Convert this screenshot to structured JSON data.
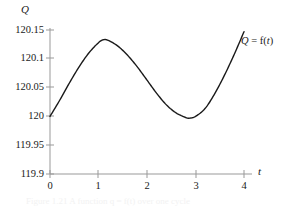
{
  "figure": {
    "y_axis_label": "Q",
    "x_axis_label": "t",
    "curve_annotation_var": "Q",
    "curve_annotation_eq": " = f(",
    "curve_annotation_arg": "t",
    "curve_annotation_close": ")",
    "caption": "Figure 1.21   A function q = f(t) over one cycle",
    "axis_color": "#999999",
    "curve_color": "#1a1a1a",
    "text_color": "#1a1a1a"
  },
  "chart_data": {
    "type": "line",
    "title": "",
    "xlabel": "t",
    "ylabel": "Q",
    "xlim": [
      0,
      4
    ],
    "ylim": [
      119.9,
      120.15
    ],
    "grid": false,
    "legend": "annotation-right",
    "annotations": [
      {
        "text": "Q = f(t)",
        "x": 4.0,
        "y": 120.14
      }
    ],
    "xticks": [
      "0",
      "1",
      "2",
      "3",
      "4"
    ],
    "xtick_values": [
      0,
      1,
      2,
      3,
      4
    ],
    "yticks": [
      "119.9",
      "119.95",
      "120",
      "120.05",
      "120.1",
      "120.15"
    ],
    "ytick_values": [
      119.9,
      119.95,
      120,
      120.05,
      120.1,
      120.15
    ],
    "series": [
      {
        "name": "Q = f(t)",
        "x": [
          0,
          0.2,
          0.4,
          0.6,
          0.8,
          1.0,
          1.1,
          1.2,
          1.4,
          1.6,
          1.8,
          2.0,
          2.2,
          2.4,
          2.6,
          2.8,
          2.88,
          3.0,
          3.2,
          3.4,
          3.6,
          3.8,
          4.0
        ],
        "values": [
          120.0,
          120.028,
          120.058,
          120.086,
          120.11,
          120.128,
          120.133,
          120.132,
          120.122,
          120.106,
          120.086,
          120.063,
          120.04,
          120.02,
          120.006,
          119.998,
          119.997,
          120.0,
          120.014,
          120.04,
          120.072,
          120.108,
          120.147
        ]
      }
    ],
    "key_points": {
      "start": {
        "t": 0,
        "q": 120.0
      },
      "maximum": {
        "t": 1.1,
        "q": 120.133
      },
      "minimum": {
        "t": 2.88,
        "q": 119.997
      },
      "end": {
        "t": 4.0,
        "q": 120.147
      }
    }
  }
}
